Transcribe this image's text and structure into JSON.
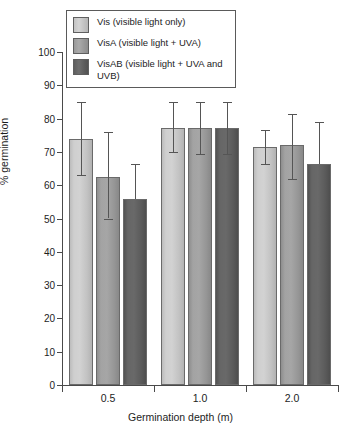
{
  "chart_data": {
    "type": "bar",
    "title": "",
    "xlabel": "Germination depth (m)",
    "ylabel": "% germination",
    "categories": [
      "0.5",
      "1.0",
      "2.0"
    ],
    "ylim": [
      0,
      100
    ],
    "yticks": [
      0,
      10,
      20,
      30,
      40,
      50,
      60,
      70,
      80,
      90,
      100
    ],
    "grid": false,
    "legend_position": "top-left",
    "series": [
      {
        "name": "Vis (visible light only)",
        "short": "Vis",
        "color": "#c8c8c8",
        "values": [
          74.0,
          77.3,
          71.5
        ],
        "err_low": [
          63.0,
          70.0,
          66.5
        ],
        "err_high": [
          85.0,
          85.0,
          76.5
        ]
      },
      {
        "name": "VisA (visible light + UVA)",
        "short": "VisA",
        "color": "#9e9e9e",
        "values": [
          62.5,
          77.3,
          72.0
        ],
        "err_low": [
          50.0,
          69.5,
          62.0
        ],
        "err_high": [
          76.0,
          85.0,
          81.5
        ]
      },
      {
        "name": "VisAB (visible light + UVA and UVB)",
        "short": "VisAB",
        "color": "#5c5c5c",
        "values": [
          56.0,
          77.3,
          66.5
        ],
        "err_low": [
          56.0,
          69.5,
          66.5
        ],
        "err_high": [
          66.5,
          85.0,
          79.0
        ]
      }
    ]
  },
  "legend": {
    "items": [
      {
        "label": "Vis (visible light only)"
      },
      {
        "label": "VisA (visible light + UVA)"
      },
      {
        "label": "VisAB (visible light + UVA and UVB)"
      }
    ]
  },
  "axes": {
    "y_title": "% germination",
    "x_title": "Germination depth (m)",
    "y_tick_labels": [
      "100",
      "90",
      "80",
      "70",
      "60",
      "50",
      "40",
      "30",
      "20",
      "10",
      "0"
    ],
    "x_tick_labels": [
      "0.5",
      "1.0",
      "2.0"
    ]
  }
}
